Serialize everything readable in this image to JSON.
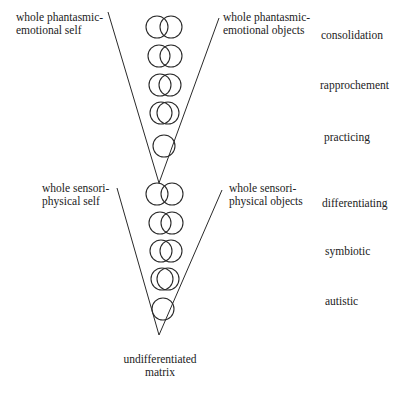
{
  "diagram": {
    "type": "developmental-stage-diagram",
    "upper_cone": {
      "left_label": [
        "whole phantasmic-",
        "emotional self"
      ],
      "right_label": [
        "whole phantasmic-",
        "emotional objects"
      ]
    },
    "lower_cone": {
      "left_label": [
        "whole sensori-",
        "physical self"
      ],
      "right_label": [
        "whole sensori-",
        "physical objects"
      ]
    },
    "bottom_label": [
      "undifferentiated",
      "matrix"
    ],
    "stages": [
      {
        "label": "consolidation"
      },
      {
        "label": "rapprochement"
      },
      {
        "label": "practicing"
      },
      {
        "label": "differentiating"
      },
      {
        "label": "symbiotic"
      },
      {
        "label": "autistic"
      }
    ],
    "stroke_color": "#2a2a2a",
    "upper_circles": [
      {
        "cy": 27,
        "cx": [
          157,
          171
        ]
      },
      {
        "cy": 56,
        "cx": [
          159,
          171
        ]
      },
      {
        "cy": 85,
        "cx": [
          160,
          170
        ]
      },
      {
        "cy": 113,
        "cx": [
          161,
          168
        ]
      },
      {
        "cy": 146,
        "cx": [
          164
        ]
      }
    ],
    "lower_circles": [
      {
        "cy": 194,
        "cx": [
          157,
          172
        ]
      },
      {
        "cy": 223,
        "cx": [
          160,
          172
        ]
      },
      {
        "cy": 251,
        "cx": [
          161,
          171
        ]
      },
      {
        "cy": 279,
        "cx": [
          162,
          168
        ]
      },
      {
        "cy": 309,
        "cx": [
          163
        ]
      }
    ]
  }
}
